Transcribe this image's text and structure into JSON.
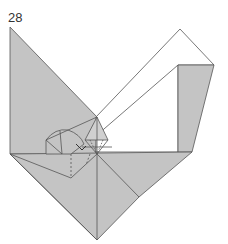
{
  "diagram": {
    "step_number": "28",
    "colors": {
      "colored_side": "#c4c4c4",
      "white_side": "#ffffff",
      "line": "#555555"
    },
    "symbols": [
      "fold-arrow",
      "dashed-valley-fold-lines"
    ]
  }
}
